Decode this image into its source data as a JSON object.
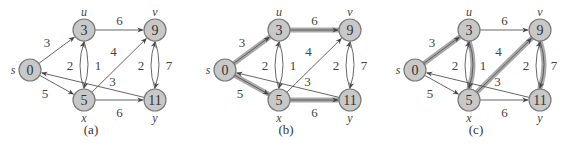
{
  "figure": {
    "colors": {
      "node_fill": "#c8c8c8",
      "node_stroke": "#7a7a7a",
      "edge": "#555555",
      "highlight": "#9a9a9a"
    },
    "nodes": [
      {
        "id": "s",
        "name": "s",
        "value": "0",
        "x": 30,
        "y": 70,
        "label_pos": "left"
      },
      {
        "id": "u",
        "name": "u",
        "value": "3",
        "x": 84,
        "y": 30,
        "label_pos": "top"
      },
      {
        "id": "v",
        "name": "v",
        "value": "9",
        "x": 155,
        "y": 30,
        "label_pos": "top"
      },
      {
        "id": "x",
        "name": "x",
        "value": "5",
        "x": 84,
        "y": 100,
        "label_pos": "bottom"
      },
      {
        "id": "y",
        "name": "y",
        "value": "11",
        "x": 155,
        "y": 100,
        "label_pos": "bottom"
      }
    ],
    "edges": [
      {
        "from": "s",
        "to": "u",
        "weight": "3"
      },
      {
        "from": "s",
        "to": "x",
        "weight": "5"
      },
      {
        "from": "u",
        "to": "v",
        "weight": "6"
      },
      {
        "from": "u",
        "to": "x",
        "weight": "2"
      },
      {
        "from": "x",
        "to": "u",
        "weight": "1"
      },
      {
        "from": "x",
        "to": "v",
        "weight": "4"
      },
      {
        "from": "x",
        "to": "y",
        "weight": "6"
      },
      {
        "from": "v",
        "to": "y",
        "weight": "2"
      },
      {
        "from": "y",
        "to": "v",
        "weight": "7"
      },
      {
        "from": "y",
        "to": "s",
        "weight": "3"
      }
    ],
    "panels": [
      {
        "caption": "(a)",
        "offset_x": 0,
        "highlighted_edges": []
      },
      {
        "caption": "(b)",
        "offset_x": 195,
        "highlighted_edges": [
          "s-u",
          "s-x",
          "u-v",
          "x-y"
        ]
      },
      {
        "caption": "(c)",
        "offset_x": 385,
        "highlighted_edges": [
          "s-u",
          "u-x",
          "x-v",
          "v-y"
        ]
      }
    ]
  }
}
